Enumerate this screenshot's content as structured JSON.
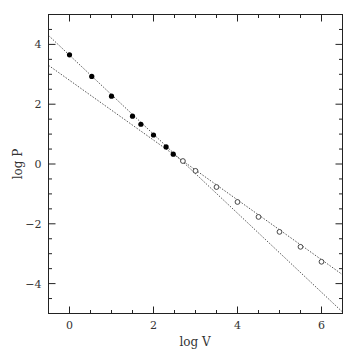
{
  "chart_data": {
    "type": "scatter",
    "title": "",
    "xlabel": "log V",
    "ylabel": "log P",
    "xlim": [
      -0.5,
      6.5
    ],
    "ylim": [
      -5,
      5
    ],
    "x_major_ticks": [
      0,
      2,
      4,
      6
    ],
    "x_tick_labels": [
      "0",
      "2",
      "4",
      "6"
    ],
    "x_minor_step": 0.5,
    "y_major_ticks": [
      -4,
      -2,
      0,
      2,
      4
    ],
    "y_tick_labels": [
      "−4",
      "−2",
      "0",
      "2",
      "4"
    ],
    "y_minor_step": 0.5,
    "grid": false,
    "legend": null,
    "series": [
      {
        "name": "filled points",
        "marker": "filled-circle",
        "x": [
          0.0,
          0.53,
          1.0,
          1.5,
          1.7,
          2.0,
          2.3,
          2.47
        ],
        "y": [
          3.65,
          2.93,
          2.27,
          1.6,
          1.33,
          0.97,
          0.57,
          0.33
        ]
      },
      {
        "name": "open points",
        "marker": "open-circle",
        "x": [
          2.7,
          3.0,
          3.5,
          4.0,
          4.5,
          5.0,
          5.5,
          6.0
        ],
        "y": [
          0.1,
          -0.23,
          -0.77,
          -1.27,
          -1.77,
          -2.27,
          -2.77,
          -3.27
        ]
      }
    ],
    "lines": [
      {
        "name": "steep fit (dotted)",
        "style": "dotted",
        "x": [
          -0.5,
          6.5
        ],
        "y": [
          4.3,
          -4.95
        ]
      },
      {
        "name": "shallow fit (dotted)",
        "style": "dotted",
        "x": [
          -0.5,
          6.5
        ],
        "y": [
          3.3,
          -3.7
        ]
      }
    ]
  }
}
